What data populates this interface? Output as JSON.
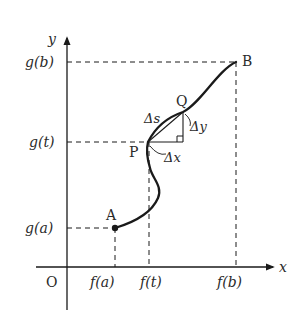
{
  "diagram": {
    "type": "parametric-curve-arc-length",
    "axes": {
      "x_label": "x",
      "y_label": "y",
      "origin_label": "O"
    },
    "x_ticks": [
      "f(a)",
      "f(t)",
      "f(b)"
    ],
    "y_ticks": [
      "g(a)",
      "g(t)",
      "g(b)"
    ],
    "points": {
      "A": "A",
      "B": "B",
      "P": "P",
      "Q": "Q"
    },
    "increments": {
      "ds": "Δs",
      "dx": "Δx",
      "dy": "Δy"
    },
    "colors": {
      "line": "#1a1a1a",
      "text": "#2a2a2a",
      "background": "#ffffff"
    }
  }
}
